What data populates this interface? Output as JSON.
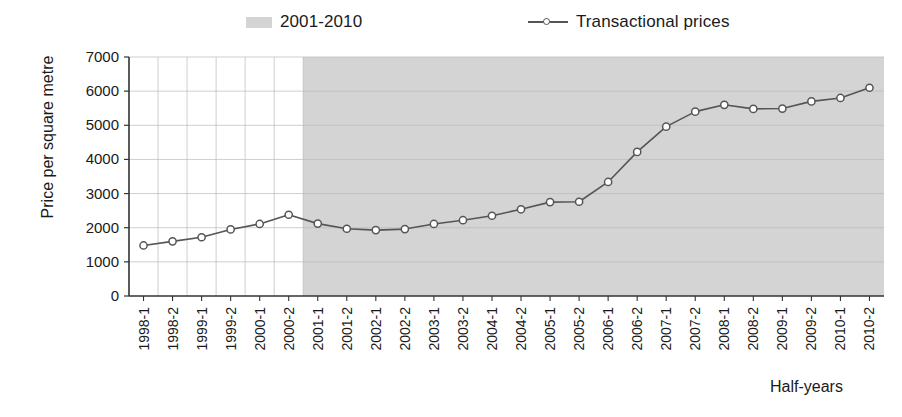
{
  "legend": {
    "band": {
      "label": "2001-2010",
      "swatch_name": "shaded-band-swatch",
      "color": "#d4d4d4"
    },
    "line": {
      "label": "Transactional prices",
      "swatch_name": "line-marker-swatch",
      "color": "#555555"
    }
  },
  "axis_titles": {
    "y": "Price per square metre",
    "x": "Half-years"
  },
  "chart_data": {
    "type": "line",
    "title": "",
    "xlabel": "Half-years",
    "ylabel": "Price per square metre",
    "ylim": [
      0,
      7000
    ],
    "ytick_step": 1000,
    "yticks": [
      "0",
      "1000",
      "2000",
      "3000",
      "4000",
      "5000",
      "6000",
      "7000"
    ],
    "grid": true,
    "legend_position": "top",
    "categories": [
      "1998-1",
      "1998-2",
      "1999-1",
      "1999-2",
      "2000-1",
      "2000-2",
      "2001-1",
      "2001-2",
      "2002-1",
      "2002-2",
      "2003-1",
      "2003-2",
      "2004-1",
      "2004-2",
      "2005-1",
      "2005-2",
      "2006-1",
      "2006-2",
      "2007-1",
      "2007-2",
      "2008-1",
      "2008-2",
      "2009-1",
      "2009-2",
      "2010-1",
      "2010-2"
    ],
    "series": [
      {
        "name": "Transactional prices",
        "color": "#555555",
        "marker": "circle",
        "values": [
          1480,
          1600,
          1720,
          1950,
          2110,
          2380,
          2120,
          1970,
          1930,
          1960,
          2110,
          2220,
          2350,
          2540,
          2750,
          2760,
          3340,
          4220,
          4960,
          5400,
          5600,
          5480,
          5490,
          5700,
          5800,
          6100
        ]
      }
    ],
    "annotations": [
      {
        "name": "shaded-band",
        "label": "2001-2010",
        "type": "x-range-band",
        "from": "2001-1",
        "to": "2010-2",
        "color": "#d4d4d4"
      }
    ]
  }
}
